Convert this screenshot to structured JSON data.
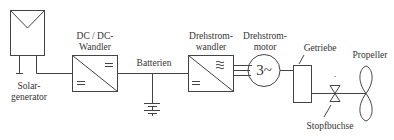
{
  "diagram": {
    "type": "block-diagram",
    "colors": {
      "stroke": "#444444",
      "text": "#333333",
      "background": "#ffffff"
    },
    "components": [
      {
        "id": "solar",
        "label_line1": "Solar-",
        "label_line2": "generator",
        "icon": "solar-panel-icon"
      },
      {
        "id": "dcdc",
        "label_line1": "DC / DC-",
        "label_line2": "Wandler",
        "icon": "dc-dc-converter-icon",
        "symbol_in": "=",
        "symbol_out": "="
      },
      {
        "id": "battery",
        "label": "Batterien",
        "icon": "battery-icon"
      },
      {
        "id": "inverter",
        "label_line1": "Drehstrom-",
        "label_line2": "wandler",
        "icon": "inverter-icon",
        "symbol_in": "=",
        "symbol_out": "≋"
      },
      {
        "id": "motor",
        "label_line1": "Drehstrom-",
        "label_line2": "motor",
        "icon": "three-phase-motor-icon",
        "symbol": "3~"
      },
      {
        "id": "gearbox",
        "label": "Getriebe",
        "icon": "gearbox-icon"
      },
      {
        "id": "stern_tube",
        "label": "Stopfbuchse",
        "icon": "stern-tube-seal-icon"
      },
      {
        "id": "propeller",
        "label": "Propeller",
        "icon": "propeller-icon"
      }
    ],
    "connections": [
      [
        "solar",
        "dcdc"
      ],
      [
        "dcdc",
        "battery"
      ],
      [
        "battery",
        "inverter"
      ],
      [
        "inverter",
        "motor"
      ],
      [
        "motor",
        "gearbox"
      ],
      [
        "gearbox",
        "stern_tube"
      ],
      [
        "stern_tube",
        "propeller"
      ]
    ]
  }
}
